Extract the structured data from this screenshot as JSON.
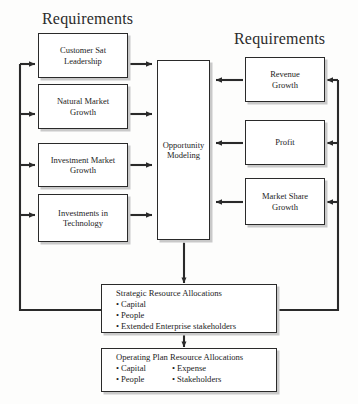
{
  "diagram": {
    "type": "block-flow-diagram",
    "headings": [
      {
        "id": "left-requirements",
        "text": "Requirements"
      },
      {
        "id": "right-requirements",
        "text": "Requirements"
      }
    ],
    "left_inputs": [
      {
        "id": "customer-sat-leadership",
        "line1": "Customer Sat",
        "line2": "Leadership"
      },
      {
        "id": "natural-market-growth",
        "line1": "Natural Market",
        "line2": "Growth"
      },
      {
        "id": "investment-market-growth",
        "line1": "Investment Market",
        "line2": "Growth"
      },
      {
        "id": "investments-in-technology",
        "line1": "Investments in",
        "line2": "Technology"
      }
    ],
    "center": {
      "id": "opportunity-modeling",
      "line1": "Opportunity",
      "line2": "Modeling"
    },
    "right_inputs": [
      {
        "id": "revenue-growth",
        "line1": "Revenue",
        "line2": "Growth"
      },
      {
        "id": "profit",
        "line1": "Profit",
        "line2": ""
      },
      {
        "id": "market-share-growth",
        "line1": "Market Share",
        "line2": "Growth"
      }
    ],
    "strategic": {
      "id": "strategic-resource-allocations",
      "title": "Strategic Resource Allocations",
      "bullets": [
        "Capital",
        "People",
        "Extended Enterprise stakeholders"
      ]
    },
    "operating": {
      "id": "operating-plan-resource-allocations",
      "title": "Operating Plan Resource Allocations",
      "bullets_col1": [
        "Capital",
        "People"
      ],
      "bullets_col2": [
        "Expense",
        "Stakeholders"
      ]
    },
    "colors": {
      "stroke": "#2a2a2a",
      "box_fill": "#ffffff",
      "shadow": "#c9c9c9",
      "background": "#fdfdfc",
      "text": "#1d1d1d"
    }
  }
}
